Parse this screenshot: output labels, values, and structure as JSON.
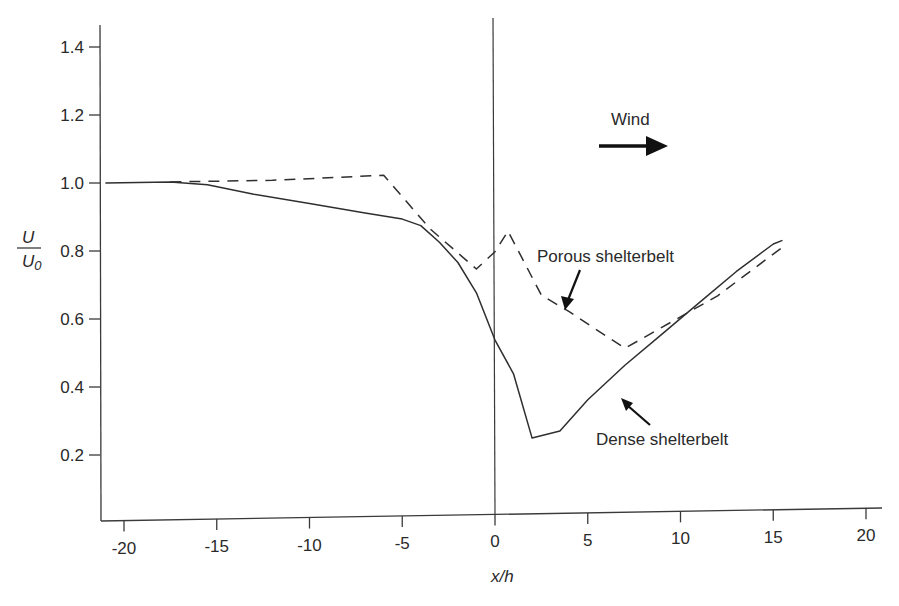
{
  "chart_data": {
    "type": "line",
    "title": "",
    "xlabel": "x/h",
    "ylabel": "U/U0",
    "ylabel_numerator": "U",
    "ylabel_denominator": "U0",
    "xlim": [
      -21,
      21
    ],
    "ylim": [
      0,
      1.45
    ],
    "grid": false,
    "legend": "none (inline annotations with arrows)",
    "x_ticks": [
      -20,
      -15,
      -10,
      -5,
      0,
      5,
      10,
      15,
      20
    ],
    "x_tick_labels": [
      "-20",
      "-15",
      "-10",
      "-5",
      "0",
      "5",
      "10",
      "15",
      "20"
    ],
    "y_ticks": [
      0.2,
      0.4,
      0.6,
      0.8,
      1.0,
      1.2,
      1.4
    ],
    "y_tick_labels": [
      "0.2",
      "0.4",
      "0.6",
      "0.8",
      "1.0",
      "1.2",
      "1.4"
    ],
    "reference_line": {
      "x": 0,
      "description": "vertical line marking shelterbelt position"
    },
    "series": [
      {
        "name": "Dense shelterbelt",
        "style": "solid",
        "x": [
          -21,
          -17.5,
          -15.5,
          -13,
          -10,
          -7,
          -5,
          -4,
          -3,
          -2,
          -1,
          0,
          1,
          2,
          3.5,
          5,
          7,
          9,
          11,
          13,
          15,
          15.5
        ],
        "values": [
          1.0,
          1.0,
          0.99,
          0.96,
          0.93,
          0.9,
          0.88,
          0.86,
          0.81,
          0.75,
          0.66,
          0.52,
          0.42,
          0.23,
          0.25,
          0.34,
          0.44,
          0.53,
          0.62,
          0.71,
          0.79,
          0.8
        ]
      },
      {
        "name": "Porous shelterbelt",
        "style": "dashed",
        "x": [
          -17.5,
          -12,
          -6,
          -3.5,
          -1,
          0,
          0.7,
          2.5,
          4,
          7,
          10,
          12,
          15.5
        ],
        "values": [
          1.0,
          1.0,
          1.01,
          0.85,
          0.73,
          0.78,
          0.84,
          0.65,
          0.6,
          0.49,
          0.58,
          0.64,
          0.78
        ]
      }
    ],
    "annotations": [
      {
        "text": "Wind",
        "arrow": "right",
        "position": [
          6.5,
          1.17
        ]
      },
      {
        "text": "Porous shelterbelt",
        "arrow_to": [
          3.9,
          0.6
        ],
        "position": [
          11,
          0.82
        ]
      },
      {
        "text": "Dense shelterbelt",
        "arrow_to": [
          6.7,
          0.38
        ],
        "position": [
          11,
          0.24
        ]
      }
    ]
  },
  "labels": {
    "wind": "Wind",
    "porous": "Porous shelterbelt",
    "dense": "Dense shelterbelt",
    "xlabel": "x/h",
    "ylabel_num": "U",
    "ylabel_den": "U",
    "ylabel_den_sub": "0"
  },
  "colors": {
    "line": "#2f2f2f",
    "axis": "#3a3a3a",
    "background": "#ffffff"
  }
}
